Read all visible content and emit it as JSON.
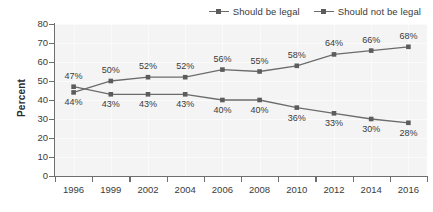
{
  "chart_data": {
    "type": "line",
    "title": "",
    "xlabel": "",
    "ylabel": "Percent",
    "ylim": [
      0,
      80
    ],
    "ytick_step": 10,
    "yticks": [
      "0",
      "10",
      "20",
      "30",
      "40",
      "50",
      "60",
      "70",
      "80"
    ],
    "grid": true,
    "legend_position": "top-right",
    "categories": [
      "1996",
      "1999",
      "2002",
      "2004",
      "2006",
      "2008",
      "2010",
      "2012",
      "2014",
      "2016"
    ],
    "series": [
      {
        "name": "Should be legal",
        "values": [
          44,
          50,
          52,
          52,
          56,
          55,
          58,
          64,
          66,
          68
        ],
        "labels": [
          "44%",
          "50%",
          "52%",
          "52%",
          "56%",
          "55%",
          "58%",
          "64%",
          "66%",
          "68%"
        ],
        "label_side": [
          "below",
          "above",
          "above",
          "above",
          "above",
          "above",
          "above",
          "above",
          "above",
          "above"
        ],
        "color": "#6b6b6b",
        "marker": "square"
      },
      {
        "name": "Should not be legal",
        "values": [
          47,
          43,
          43,
          43,
          40,
          40,
          36,
          33,
          30,
          28
        ],
        "labels": [
          "47%",
          "43%",
          "43%",
          "43%",
          "40%",
          "40%",
          "36%",
          "33%",
          "30%",
          "28%"
        ],
        "label_side": [
          "above",
          "below",
          "below",
          "below",
          "below",
          "below",
          "below",
          "below",
          "below",
          "below"
        ],
        "color": "#6b6b6b",
        "marker": "square"
      }
    ]
  },
  "legend": {
    "items": [
      {
        "label": "Should be legal"
      },
      {
        "label": "Should not be legal"
      }
    ]
  },
  "axes": {
    "y_label": "Percent"
  }
}
